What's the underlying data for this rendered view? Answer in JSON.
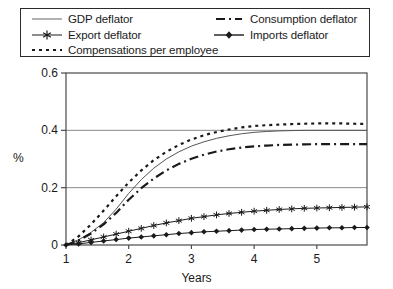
{
  "chart_data": {
    "type": "line",
    "title": "",
    "xlabel": "Years",
    "ylabel": "%",
    "xlim": [
      1,
      5.8
    ],
    "ylim": [
      0,
      0.6
    ],
    "xticks": [
      "1",
      "2",
      "3",
      "4",
      "5"
    ],
    "xtick_values": [
      1,
      2,
      3,
      4,
      5
    ],
    "yticks": [
      "0",
      "0.2",
      "0.4",
      "0.6"
    ],
    "ytick_values": [
      0,
      0.2,
      0.4,
      0.6
    ],
    "grid": "horizontal",
    "legend_position": "top",
    "x": [
      1.0,
      1.2,
      1.4,
      1.6,
      1.8,
      2.0,
      2.2,
      2.4,
      2.6,
      2.8,
      3.0,
      3.2,
      3.4,
      3.6,
      3.8,
      4.0,
      4.2,
      4.4,
      4.6,
      4.8,
      5.0,
      5.2,
      5.4,
      5.6,
      5.8
    ],
    "series": [
      {
        "name": "GDP deflator",
        "style": "solid-thin",
        "marker": "none",
        "color": "#555555",
        "values": [
          0.0,
          0.018,
          0.044,
          0.078,
          0.125,
          0.18,
          0.228,
          0.268,
          0.3,
          0.325,
          0.345,
          0.36,
          0.372,
          0.381,
          0.388,
          0.393,
          0.396,
          0.398,
          0.399,
          0.4,
          0.4,
          0.4,
          0.4,
          0.4,
          0.4
        ]
      },
      {
        "name": "Consumption deflator",
        "style": "dash-dot",
        "marker": "none",
        "color": "#1a1a1a",
        "values": [
          0.0,
          0.016,
          0.04,
          0.072,
          0.112,
          0.158,
          0.198,
          0.232,
          0.26,
          0.283,
          0.301,
          0.315,
          0.326,
          0.334,
          0.34,
          0.344,
          0.347,
          0.349,
          0.35,
          0.351,
          0.352,
          0.352,
          0.352,
          0.352,
          0.352
        ]
      },
      {
        "name": "Export deflator",
        "style": "solid-thin",
        "marker": "asterisk",
        "color": "#1a1a1a",
        "values": [
          0.0,
          0.008,
          0.018,
          0.028,
          0.038,
          0.048,
          0.058,
          0.068,
          0.077,
          0.085,
          0.093,
          0.099,
          0.105,
          0.11,
          0.114,
          0.118,
          0.121,
          0.124,
          0.126,
          0.128,
          0.129,
          0.13,
          0.131,
          0.132,
          0.133
        ]
      },
      {
        "name": "Imports deflator",
        "style": "solid-thin",
        "marker": "diamond",
        "color": "#1a1a1a",
        "values": [
          0.0,
          0.004,
          0.009,
          0.014,
          0.019,
          0.024,
          0.028,
          0.032,
          0.036,
          0.04,
          0.043,
          0.046,
          0.048,
          0.05,
          0.052,
          0.054,
          0.055,
          0.056,
          0.057,
          0.058,
          0.059,
          0.06,
          0.06,
          0.061,
          0.061
        ]
      },
      {
        "name": "Compensations per employee",
        "style": "dotted",
        "marker": "none",
        "color": "#1a1a1a",
        "values": [
          0.0,
          0.03,
          0.072,
          0.12,
          0.17,
          0.218,
          0.26,
          0.296,
          0.325,
          0.349,
          0.368,
          0.383,
          0.394,
          0.403,
          0.41,
          0.415,
          0.418,
          0.42,
          0.422,
          0.423,
          0.424,
          0.424,
          0.424,
          0.423,
          0.422
        ]
      }
    ]
  },
  "legend": {
    "items": [
      {
        "label": "GDP deflator",
        "swatch": "solid-thin-line-swatch"
      },
      {
        "label": "Export deflator",
        "swatch": "asterisk-line-swatch"
      },
      {
        "label": "Compensations per employee",
        "swatch": "dotted-line-swatch"
      },
      {
        "label": "Consumption deflator",
        "swatch": "dash-dot-line-swatch"
      },
      {
        "label": "Imports deflator",
        "swatch": "diamond-line-swatch"
      }
    ]
  },
  "axes": {
    "y_axis_label": "%",
    "x_axis_label": "Years",
    "y_tick_0": "0",
    "y_tick_1": "0.2",
    "y_tick_2": "0.4",
    "y_tick_3": "0.6",
    "x_tick_0": "1",
    "x_tick_1": "2",
    "x_tick_2": "3",
    "x_tick_3": "4",
    "x_tick_4": "5"
  }
}
